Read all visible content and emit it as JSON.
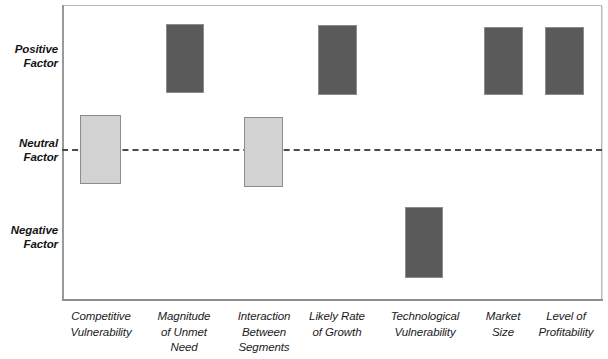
{
  "chart_data": {
    "type": "bar",
    "title": "",
    "subtitle": "",
    "xlabel": "",
    "ylabel": "",
    "orientation": "vertical",
    "grid": false,
    "legend": null,
    "y_axis": {
      "type": "categorical-qualitative",
      "tick_labels": [
        "Positive Factor",
        "Neutral Factor",
        "Negative Factor"
      ],
      "reference_line": {
        "label": "Neutral Factor",
        "style": "dashed",
        "color": "#4a4a4a"
      }
    },
    "categories": [
      "Competitive Vulnerability",
      "Magnitude of Unmet Need",
      "Interaction Between Segments",
      "Likely Rate of Growth",
      "Technological Vulnerability",
      "Market Size",
      "Level of Profitability"
    ],
    "series": [
      {
        "name": "Factor rating range",
        "values": [
          {
            "category": "Competitive Vulnerability",
            "low": -0.23,
            "high": 0.35,
            "rating": "Neutral",
            "color": "#d2d2d2"
          },
          {
            "category": "Magnitude of Unmet Need",
            "low": 0.57,
            "high": 1.0,
            "rating": "Positive",
            "color": "#5a5a5a"
          },
          {
            "category": "Interaction Between Segments",
            "low": -0.26,
            "high": 0.23,
            "rating": "Neutral",
            "color": "#d2d2d2"
          },
          {
            "category": "Likely Rate of Growth",
            "low": 0.55,
            "high": 0.99,
            "rating": "Positive",
            "color": "#5a5a5a"
          },
          {
            "category": "Technological Vulnerability",
            "low": -0.92,
            "high": -0.42,
            "rating": "Negative",
            "color": "#5a5a5a"
          },
          {
            "category": "Market Size",
            "low": 0.55,
            "high": 0.97,
            "rating": "Positive",
            "color": "#5a5a5a"
          },
          {
            "category": "Level of Profitability",
            "low": 0.55,
            "high": 0.97,
            "rating": "Positive",
            "color": "#5a5a5a"
          }
        ]
      }
    ],
    "ylim": [
      -1.05,
      1.05
    ],
    "colors": {
      "positive_bar": "#5a5a5a",
      "neutral_bar": "#d2d2d2",
      "bar_border": "#8c8c8c",
      "frame": "#b9b9b9",
      "reference_line": "#4a4a4a",
      "text": "#141414",
      "background": "#ffffff"
    }
  },
  "y_axis_labels": [
    {
      "line1": "Positive",
      "line2": "Factor"
    },
    {
      "line1": "Neutral",
      "line2": "Factor"
    },
    {
      "line1": "Negative",
      "line2": "Factor"
    }
  ],
  "x_axis_labels": [
    {
      "line1": "Competitive",
      "line2": "Vulnerability",
      "line3": ""
    },
    {
      "line1": "Magnitude",
      "line2": "of Unmet",
      "line3": "Need"
    },
    {
      "line1": "Interaction",
      "line2": "Between",
      "line3": "Segments"
    },
    {
      "line1": "Likely Rate",
      "line2": "of Growth",
      "line3": ""
    },
    {
      "line1": "Technological",
      "line2": "Vulnerability",
      "line3": ""
    },
    {
      "line1": "Market",
      "line2": "Size",
      "line3": ""
    },
    {
      "line1": "Level of",
      "line2": "Profitability",
      "line3": ""
    }
  ],
  "bar_geometry": [
    {
      "left": 80,
      "top": 115,
      "width": 41,
      "height": 69,
      "fill": "#d2d2d2"
    },
    {
      "left": 166,
      "top": 24,
      "width": 38,
      "height": 69,
      "fill": "#5a5a5a"
    },
    {
      "left": 244,
      "top": 117,
      "width": 39,
      "height": 70,
      "fill": "#d2d2d2"
    },
    {
      "left": 318,
      "top": 25,
      "width": 39,
      "height": 70,
      "fill": "#5a5a5a"
    },
    {
      "left": 405,
      "top": 207,
      "width": 38,
      "height": 71,
      "fill": "#5a5a5a"
    },
    {
      "left": 484,
      "top": 27,
      "width": 39,
      "height": 68,
      "fill": "#5a5a5a"
    },
    {
      "left": 545,
      "top": 27,
      "width": 39,
      "height": 68,
      "fill": "#5a5a5a"
    }
  ]
}
